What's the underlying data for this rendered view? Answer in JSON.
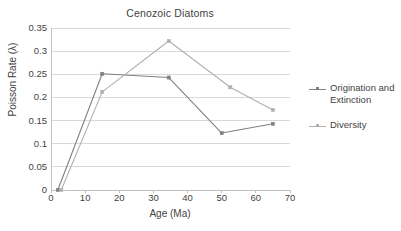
{
  "chart_data": {
    "type": "line",
    "title": "Cenozoic Diatoms",
    "xlabel": "Age (Ma)",
    "ylabel": "Poisson Rate (λ)",
    "xlim": [
      0,
      70
    ],
    "ylim": [
      0,
      0.35
    ],
    "xticks": [
      "0",
      "10",
      "20",
      "30",
      "40",
      "50",
      "60",
      "70"
    ],
    "xtick_values": [
      0,
      10,
      20,
      30,
      40,
      50,
      60,
      70
    ],
    "yticks": [
      "0",
      "0.05",
      "0.1",
      "0.15",
      "0.2",
      "0.25",
      "0.3",
      "0.35"
    ],
    "ytick_values": [
      0,
      0.05,
      0.1,
      0.15,
      0.2,
      0.25,
      0.3,
      0.35
    ],
    "grid": "horizontal",
    "legend_position": "right",
    "series": [
      {
        "name": "Origination and Extinction",
        "color": "#808080",
        "marker": "square",
        "x": [
          2,
          15,
          34.5,
          50,
          65
        ],
        "values": [
          0,
          0.251,
          0.243,
          0.123,
          0.143
        ]
      },
      {
        "name": "Diversity",
        "color": "#b0b0b0",
        "marker": "square",
        "x": [
          3,
          15,
          34.5,
          52.5,
          65
        ],
        "values": [
          0,
          0.212,
          0.322,
          0.222,
          0.173
        ]
      }
    ]
  },
  "legend": {
    "entries": [
      {
        "label_line1": "Origination and",
        "label_line2": "Extinction"
      },
      {
        "label_line1": "Diversity",
        "label_line2": ""
      }
    ]
  },
  "colors": {
    "series1": "#808080",
    "series2": "#b0b0b0",
    "gridline": "#d9d9d9",
    "axis": "#bfbfbf",
    "text": "#3f3f3f",
    "background": "#ffffff"
  }
}
